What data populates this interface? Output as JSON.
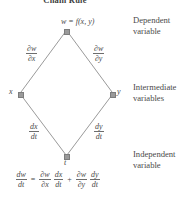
{
  "figure": {
    "title": "Chain Rule",
    "nodes": {
      "top": "w = f(x, y)",
      "left": "x",
      "right": "y",
      "bottom": "t"
    },
    "edge_labels": {
      "upper_left": {
        "numerator": "∂w",
        "denominator": "∂x"
      },
      "upper_right": {
        "numerator": "∂w",
        "denominator": "∂y"
      },
      "lower_left": {
        "numerator": "dx",
        "denominator": "dt"
      },
      "lower_right": {
        "numerator": "dy",
        "denominator": "dt"
      }
    },
    "category_labels": {
      "dependent": "Dependent\nvariable",
      "dependent_line1": "Dependent",
      "dependent_line2": "variable",
      "intermediate_line1": "Intermediate",
      "intermediate_line2": "variables",
      "independent_line1": "Independent",
      "independent_line2": "variable"
    },
    "equation": {
      "lhs": {
        "numerator": "dw",
        "denominator": "dt"
      },
      "equals": "=",
      "term1_a": {
        "numerator": "∂w",
        "denominator": "∂x"
      },
      "term1_b": {
        "numerator": "dx",
        "denominator": "dt"
      },
      "plus": "+",
      "term2_a": {
        "numerator": "∂w",
        "denominator": "∂y"
      },
      "term2_b": {
        "numerator": "dy",
        "denominator": "dt"
      }
    },
    "colors": {
      "edge": "#9a9a9a",
      "node": "#9a9a9a",
      "text": "#4a4a4a"
    }
  }
}
